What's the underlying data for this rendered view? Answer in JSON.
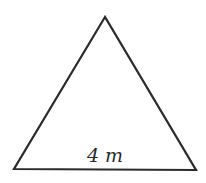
{
  "figure": {
    "shape": "equilateral triangle",
    "base_label": "4 m",
    "stroke_color": "#2b2b2b",
    "background": "#ffffff"
  }
}
